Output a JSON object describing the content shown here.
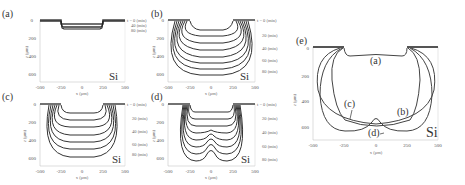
{
  "figure": {
    "panels": [
      {
        "id": "a",
        "label": "(a)",
        "material": "Si",
        "xlabel": "x (μm)",
        "ylabel": "z (μm)",
        "xticks": [
          "-500",
          "-250",
          "0",
          "250",
          "500"
        ],
        "yticks": [
          "0",
          "200",
          "400",
          "600"
        ],
        "time_labels": [
          "t = 0 (min)",
          "40 (min)",
          "80 (min)"
        ]
      },
      {
        "id": "b",
        "label": "(b)",
        "material": "Si",
        "xlabel": "x (μm)",
        "ylabel": "z (μm)",
        "xticks": [
          "-500",
          "-250",
          "0",
          "250",
          "500"
        ],
        "yticks": [
          "0",
          "200",
          "400",
          "600"
        ],
        "time_labels": [
          "t = 0 (min)",
          "20 (min)",
          "40 (min)",
          "60 (min)",
          "80 (min)"
        ]
      },
      {
        "id": "c",
        "label": "(c)",
        "material": "Si",
        "xlabel": "x (μm)",
        "ylabel": "z (μm)",
        "xticks": [
          "-500",
          "-250",
          "0",
          "250",
          "500"
        ],
        "yticks": [
          "0",
          "200",
          "400",
          "600"
        ],
        "time_labels": [
          "t = 0 (min)",
          "20 (min)",
          "40 (min)",
          "60 (min)",
          "80 (min)"
        ]
      },
      {
        "id": "d",
        "label": "(d)",
        "material": "Si",
        "xlabel": "x (μm)",
        "ylabel": "z (μm)",
        "xticks": [
          "-500",
          "-250",
          "0",
          "250",
          "500"
        ],
        "yticks": [
          "0",
          "200",
          "400",
          "600"
        ],
        "time_labels": [
          "t = 0 (min)",
          "20 (min)",
          "40 (min)",
          "60 (min)",
          "80 (min)"
        ]
      },
      {
        "id": "e",
        "label": "(e)",
        "material": "Si",
        "xlabel": "x (μm)",
        "ylabel": "z (μm)",
        "xticks": [
          "-500",
          "-250",
          "0",
          "250",
          "500"
        ],
        "yticks": [
          "0",
          "200",
          "400",
          "600"
        ],
        "curve_labels": [
          "(a)",
          "(b)",
          "(c)",
          "(d)"
        ]
      }
    ]
  }
}
